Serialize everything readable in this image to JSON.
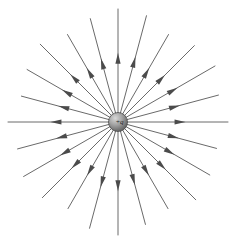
{
  "figure": {
    "width": 236,
    "height": 241,
    "background_color": "#ffffff"
  },
  "charge": {
    "label": "+q",
    "sign": "positive",
    "center_x": 118,
    "center_y": 122,
    "radius": 9.5,
    "fill_color": "#9a9a9a",
    "edge_color": "#4a4a4a",
    "highlight_color": "#d8d8d8",
    "shadow_color": "#5d5d5d"
  },
  "field_lines": {
    "count": 24,
    "angle_step_degrees": 15,
    "direction": "outward",
    "line_color": "#6a6a6a",
    "arrow_color": "#4b4b4b",
    "line_width": 1,
    "inner_radius": 9,
    "arrow_position_fraction": 0.58,
    "arrow_length": 11,
    "arrow_half_width": 2.6,
    "rays": [
      {
        "angle_degrees": 0,
        "length": 110
      },
      {
        "angle_degrees": 15,
        "length": 104
      },
      {
        "angle_degrees": 30,
        "length": 112
      },
      {
        "angle_degrees": 45,
        "length": 108
      },
      {
        "angle_degrees": 60,
        "length": 101
      },
      {
        "angle_degrees": 75,
        "length": 110
      },
      {
        "angle_degrees": 90,
        "length": 113
      },
      {
        "angle_degrees": 105,
        "length": 107
      },
      {
        "angle_degrees": 120,
        "length": 101
      },
      {
        "angle_degrees": 135,
        "length": 110
      },
      {
        "angle_degrees": 150,
        "length": 105
      },
      {
        "angle_degrees": 165,
        "length": 100
      },
      {
        "angle_degrees": 180,
        "length": 110
      },
      {
        "angle_degrees": 195,
        "length": 104
      },
      {
        "angle_degrees": 210,
        "length": 109
      },
      {
        "angle_degrees": 225,
        "length": 107
      },
      {
        "angle_degrees": 240,
        "length": 100
      },
      {
        "angle_degrees": 255,
        "length": 110
      },
      {
        "angle_degrees": 270,
        "length": 113
      },
      {
        "angle_degrees": 285,
        "length": 106
      },
      {
        "angle_degrees": 300,
        "length": 100
      },
      {
        "angle_degrees": 315,
        "length": 110
      },
      {
        "angle_degrees": 330,
        "length": 106
      },
      {
        "angle_degrees": 345,
        "length": 102
      }
    ]
  },
  "chart_data": {
    "type": "scatter",
    "xlabel": "",
    "ylabel": "",
    "legend": [],
    "annotations": [
      "+q"
    ],
    "grid": false,
    "series": [
      {
        "name": "radial field lines",
        "description": "24 straight rays emanating outward from the point charge, evenly spaced every 15 degrees, each bearing an arrowhead pointing away from the charge",
        "angles_degrees": [
          0,
          15,
          30,
          45,
          60,
          75,
          90,
          105,
          120,
          135,
          150,
          165,
          180,
          195,
          210,
          225,
          240,
          255,
          270,
          285,
          300,
          315,
          330,
          345
        ],
        "lengths": [
          110,
          104,
          112,
          108,
          101,
          110,
          113,
          107,
          101,
          110,
          105,
          100,
          110,
          104,
          109,
          107,
          100,
          110,
          113,
          106,
          100,
          110,
          106,
          102
        ]
      },
      {
        "name": "point charge",
        "description": "Shaded sphere representing the positive source charge",
        "x": [
          118
        ],
        "y": [
          122
        ],
        "label": "+q"
      }
    ]
  }
}
